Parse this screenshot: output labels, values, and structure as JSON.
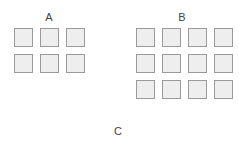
{
  "groups": [
    {
      "label": "A",
      "rows": 2,
      "cols": 3
    },
    {
      "label": "B",
      "rows": 3,
      "cols": 4
    }
  ],
  "footer_label": "C",
  "colors": {
    "box_fill": "#eeeeee",
    "box_border": "#9a9a9a",
    "text": "#444444"
  }
}
